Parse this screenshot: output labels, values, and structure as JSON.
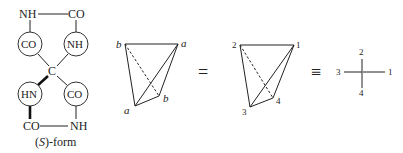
{
  "molecule": {
    "top_left": "NH",
    "top_right": "CO",
    "circle_upper_left": "CO",
    "circle_upper_right": "NH",
    "center": "C",
    "circle_lower_left": "HN",
    "circle_lower_right": "CO",
    "bottom_left": "CO",
    "bottom_right": "NH",
    "caption_prefix": "(",
    "caption_italic": "S",
    "caption_suffix": ")-form"
  },
  "tetrahedron_letters": {
    "top_left": "b",
    "top_right": "a",
    "inner_right": "b",
    "bottom_left": "a"
  },
  "equals_sign": "=",
  "tetrahedron_numbers": {
    "top_left": "2",
    "top_right": "1",
    "inner_right": "4",
    "bottom_left": "3"
  },
  "identical_sign": "≡",
  "fischer": {
    "top": "2",
    "left": "3",
    "right": "1",
    "bottom": "4"
  }
}
